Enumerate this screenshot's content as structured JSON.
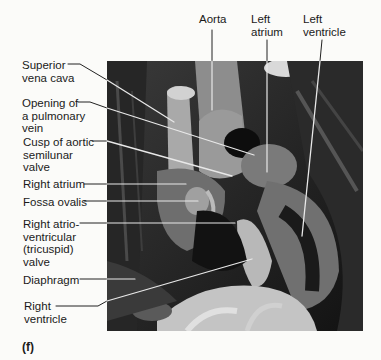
{
  "figure": {
    "panel_letter": "(f)"
  },
  "labels_left": [
    {
      "id": "superior-vena-cava",
      "text": "Superior\nvena cava"
    },
    {
      "id": "opening-pulmonary-vein",
      "text": "Opening of\na pulmonary\nvein"
    },
    {
      "id": "cusp-aortic-valve",
      "text": "Cusp of aortic\nsemilunar\nvalve"
    },
    {
      "id": "right-atrium",
      "text": "Right atrium"
    },
    {
      "id": "fossa-ovalis",
      "text": "Fossa ovalis"
    },
    {
      "id": "tricuspid-valve",
      "text": "Right atrio-\nventricular\n(tricuspid)\nvalve"
    },
    {
      "id": "diaphragm",
      "text": "Diaphragm"
    },
    {
      "id": "right-ventricle",
      "text": "Right\nventricle"
    }
  ],
  "labels_top": [
    {
      "id": "aorta",
      "text": "Aorta"
    },
    {
      "id": "left-atrium",
      "text": "Left\natrium"
    },
    {
      "id": "left-ventricle",
      "text": "Left\nventricle"
    }
  ],
  "colors": {
    "background": "#fbfbf9",
    "leader_line": "#222222",
    "leader_line_on_photo": "#e8e8e8"
  }
}
